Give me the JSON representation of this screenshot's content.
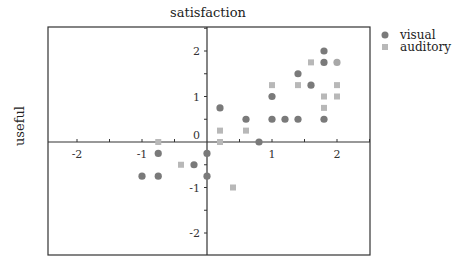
{
  "chart_data": {
    "type": "scatter",
    "title": "satisfaction",
    "xlabel": "",
    "ylabel": "useful",
    "xlim": [
      -2.45,
      2.45
    ],
    "ylim": [
      -2.5,
      2.5
    ],
    "x_ticks": [
      -2,
      -1,
      0,
      1,
      2
    ],
    "y_ticks": [
      -2,
      -1,
      0,
      1,
      2
    ],
    "x_tick_labels": [
      "-2",
      "-1",
      "0",
      "1",
      "2"
    ],
    "y_tick_labels": [
      "-2",
      "-1",
      "0",
      "1",
      "2"
    ],
    "axes_through_origin": true,
    "grid": false,
    "legend_position": "top-right-outside",
    "series": [
      {
        "name": "visual",
        "marker": "circle",
        "color": "#7a7a7a",
        "points": [
          [
            -1.0,
            -0.75
          ],
          [
            -0.75,
            -0.75
          ],
          [
            -0.75,
            -0.25
          ],
          [
            -0.2,
            -0.5
          ],
          [
            0.0,
            -0.25
          ],
          [
            0.0,
            -0.75
          ],
          [
            0.2,
            0.75
          ],
          [
            0.6,
            0.5
          ],
          [
            0.8,
            0.0
          ],
          [
            1.0,
            1.0
          ],
          [
            1.0,
            0.5
          ],
          [
            1.2,
            0.5
          ],
          [
            1.4,
            0.5
          ],
          [
            1.4,
            1.5
          ],
          [
            1.6,
            1.25
          ],
          [
            1.8,
            2.0
          ],
          [
            1.8,
            1.75
          ],
          [
            1.8,
            0.5
          ],
          [
            2.0,
            1.75
          ]
        ]
      },
      {
        "name": "auditory",
        "marker": "square",
        "color": "#b8b8b8",
        "points": [
          [
            -0.75,
            0.0
          ],
          [
            -0.4,
            -0.5
          ],
          [
            0.2,
            0.0
          ],
          [
            0.2,
            0.25
          ],
          [
            0.4,
            -1.0
          ],
          [
            0.6,
            0.25
          ],
          [
            1.0,
            1.25
          ],
          [
            1.4,
            1.25
          ],
          [
            1.6,
            1.75
          ],
          [
            1.8,
            1.0
          ],
          [
            1.8,
            0.75
          ],
          [
            2.0,
            1.25
          ],
          [
            2.0,
            1.0
          ]
        ]
      }
    ]
  }
}
